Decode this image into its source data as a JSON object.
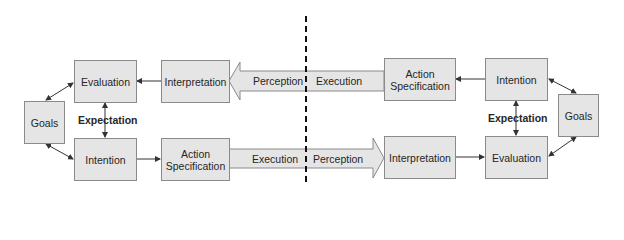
{
  "diagram": {
    "type": "two-party interaction cycle",
    "divider": "dashed vertical line",
    "left": {
      "goals": "Goals",
      "evaluation": "Evaluation",
      "intention": "Intention",
      "interpretation": "Interpretation",
      "action_specification_line1": "Action",
      "action_specification_line2": "Specification",
      "expectation": "Expectation",
      "perception_arrow": "Perception",
      "execution_arrow": "Execution"
    },
    "right": {
      "goals": "Goals",
      "evaluation": "Evaluation",
      "intention": "Intention",
      "interpretation": "Interpretation",
      "action_specification_line1": "Action",
      "action_specification_line2": "Specification",
      "expectation": "Expectation",
      "execution_arrow": "Execution",
      "perception_arrow": "Perception"
    },
    "colors": {
      "box_fill": "#e5e5e5",
      "box_border": "#8a8a8a",
      "text": "#262626",
      "arrow": "#333333"
    }
  }
}
